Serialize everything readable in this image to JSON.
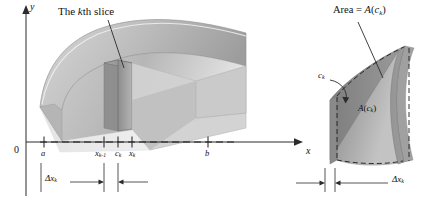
{
  "figure": {
    "type": "math-diagram",
    "topic": "volume-by-slicing",
    "panels": 2,
    "colors": {
      "ink": "#111111",
      "axis": "#2b2b2b",
      "solid_light": "#e9e9e9",
      "solid_mid": "#c9c9c9",
      "solid_dark": "#a8a8a8",
      "solid_darker": "#8e8e8e",
      "slab_face": "#9a9a9a",
      "background": "#ffffff"
    }
  },
  "left_panel": {
    "callout_label": "The kth slice",
    "callout_prefix": "The ",
    "callout_italic": "k",
    "callout_suffix": "th slice",
    "axes": {
      "y_label": "y",
      "x_label": "x",
      "origin_label": "0"
    },
    "ticks": [
      {
        "name": "a",
        "base": "a",
        "sub": ""
      },
      {
        "name": "x_k-1",
        "base": "x",
        "sub": "k-1"
      },
      {
        "name": "c_k",
        "base": "c",
        "sub": "k"
      },
      {
        "name": "x_k",
        "base": "x",
        "sub": "k"
      },
      {
        "name": "b",
        "base": "b",
        "sub": ""
      }
    ],
    "width_label": {
      "base": "Δx",
      "sub": "k"
    }
  },
  "right_panel": {
    "area_label": {
      "prefix": "Area = ",
      "fn": "A",
      "open": "(",
      "base": "c",
      "sub": "k",
      "close": ")"
    },
    "point_label": {
      "base": "c",
      "sub": "k"
    },
    "face_label": {
      "fn": "A",
      "open": "(",
      "base": "c",
      "sub": "k",
      "close": ")"
    },
    "width_label": {
      "base": "Δx",
      "sub": "k"
    }
  }
}
